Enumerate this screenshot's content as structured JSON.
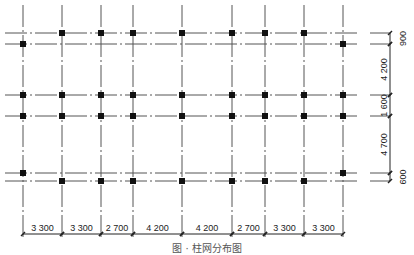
{
  "diagram": {
    "type": "column-grid-plan",
    "caption": "图 · 柱网分布图",
    "colors": {
      "line": "#555555",
      "column": "#111111",
      "text": "#222222",
      "background": "#ffffff"
    },
    "grid_x": [
      23,
      62,
      101,
      133,
      182,
      232,
      265,
      304,
      343
    ],
    "grid_y": [
      33,
      44,
      95,
      116,
      173,
      181
    ],
    "columns": [
      {
        "y": 33,
        "xs": [
          62,
          101,
          133,
          182,
          232,
          265,
          304
        ]
      },
      {
        "y": 44,
        "xs": [
          23,
          343
        ]
      },
      {
        "y": 95,
        "xs": [
          23,
          62,
          101,
          133,
          182,
          232,
          265,
          304,
          343
        ]
      },
      {
        "y": 116,
        "xs": [
          23,
          62,
          101,
          133,
          182,
          232,
          265,
          304,
          343
        ]
      },
      {
        "y": 173,
        "xs": [
          23,
          343
        ]
      },
      {
        "y": 181,
        "xs": [
          62,
          101,
          133,
          182,
          232,
          265,
          304
        ]
      }
    ],
    "bottom_dimensions": {
      "y": 234,
      "spans": [
        {
          "from": 23,
          "to": 62,
          "label": "3 300"
        },
        {
          "from": 62,
          "to": 101,
          "label": "3 300"
        },
        {
          "from": 101,
          "to": 133,
          "label": "2 700"
        },
        {
          "from": 133,
          "to": 182,
          "label": "4 200"
        },
        {
          "from": 182,
          "to": 232,
          "label": "4 200"
        },
        {
          "from": 232,
          "to": 265,
          "label": "2 700"
        },
        {
          "from": 265,
          "to": 304,
          "label": "3 300"
        },
        {
          "from": 304,
          "to": 343,
          "label": "3 300"
        }
      ]
    },
    "right_dimensions": {
      "x": 390,
      "spans": [
        {
          "from": 33,
          "to": 44,
          "label": "900"
        },
        {
          "from": 44,
          "to": 95,
          "label": "4 200"
        },
        {
          "from": 95,
          "to": 116,
          "label": "1 600"
        },
        {
          "from": 116,
          "to": 173,
          "label": "4 700"
        },
        {
          "from": 173,
          "to": 181,
          "label": "600"
        }
      ]
    }
  }
}
